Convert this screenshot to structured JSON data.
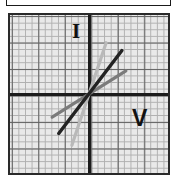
{
  "figure": {
    "kind": "iv-characteristic-graph",
    "top_frame_present": true
  },
  "labels": {
    "current_axis": "I",
    "voltage_axis": "V"
  },
  "colors": {
    "frame": "#2a2a2a",
    "plot_background": "#e9e9e9",
    "grid_minor": "#9d9d9d",
    "grid_major": "#5d5d5d",
    "axis": "#1c1c1c",
    "line_steep": "#b9b9b9",
    "line_medium": "#232323",
    "line_shallow": "#7b7b7b"
  },
  "chart_data": {
    "type": "line",
    "title": "",
    "xlabel": "V",
    "ylabel": "I",
    "xlim": [
      -6,
      6
    ],
    "ylim": [
      -6,
      6
    ],
    "grid": true,
    "grid_minor_divisions": 24,
    "grid_major_divisions": 6,
    "legend": "none",
    "origin_marked": false,
    "annotations": [
      {
        "text": "I",
        "quadrant": "upper-left-of-vertical-axis"
      },
      {
        "text": "V",
        "quadrant": "lower-right"
      }
    ],
    "series": [
      {
        "name": "steep line",
        "color": "#b9b9b9",
        "slope": 3.0,
        "intercept": 0,
        "x": [
          -1.3,
          1.3
        ],
        "y": [
          -3.9,
          3.9
        ]
      },
      {
        "name": "medium line",
        "color": "#232323",
        "slope": 1.3,
        "intercept": 0,
        "x": [
          -2.3,
          2.5
        ],
        "y": [
          -3.0,
          3.3
        ]
      },
      {
        "name": "shallow line",
        "color": "#7b7b7b",
        "slope": 0.62,
        "intercept": 0,
        "x": [
          -2.8,
          2.8
        ],
        "y": [
          -1.75,
          1.75
        ]
      }
    ]
  }
}
